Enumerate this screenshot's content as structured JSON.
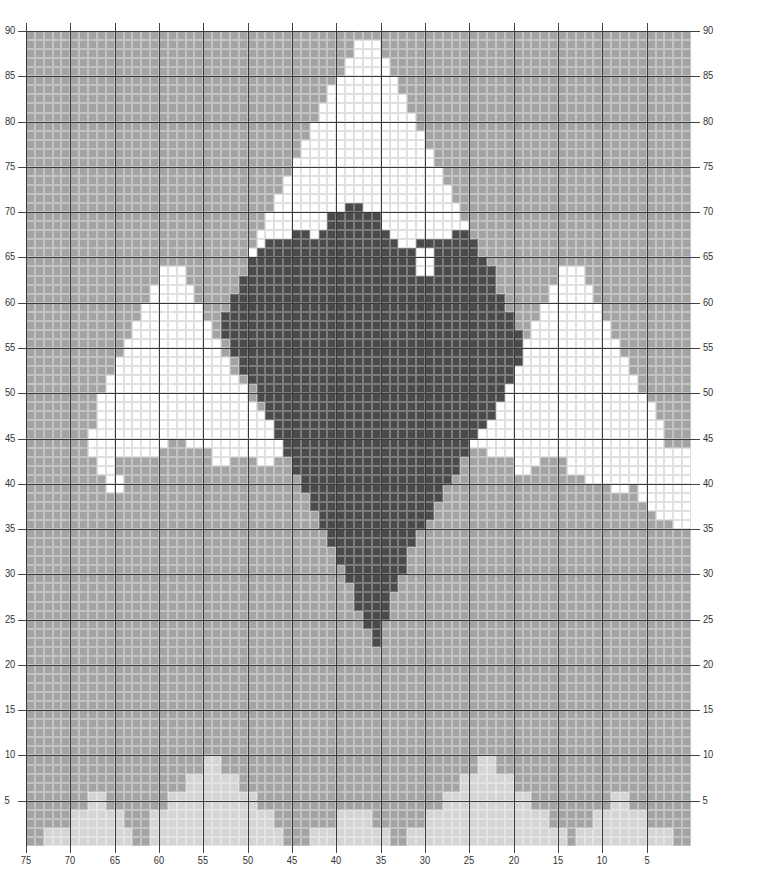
{
  "chart_data": {
    "type": "heatmap",
    "title": "",
    "columns": 75,
    "rows": 90,
    "x_axis": {
      "ticks": [
        75,
        70,
        65,
        60,
        55,
        50,
        45,
        40,
        35,
        30,
        25,
        20,
        15,
        10,
        5
      ],
      "direction": "right-to-left"
    },
    "y_axis": {
      "ticks": [
        90,
        85,
        80,
        75,
        70,
        65,
        60,
        55,
        50,
        45,
        40,
        35,
        30,
        25,
        20,
        15,
        10,
        5
      ],
      "both_sides": true
    },
    "colors": {
      "background": "#a3a3a3",
      "snow": "#ffffff",
      "dark": "#4a4a4a",
      "light": "#d4d4d4",
      "fine_grid_light": "rgba(255,255,255,0.35)",
      "fine_grid_dark": "rgba(255,255,255,0.28)",
      "fine_grid_snow": "rgba(0,0,0,0.12)",
      "major_grid": "#3a3a3a"
    },
    "legend": [
      {
        "key": "snow",
        "label": "White"
      },
      {
        "key": "dark",
        "label": "Dark grey"
      },
      {
        "key": "light",
        "label": "Light grey"
      },
      {
        "key": "background",
        "label": "Mid grey"
      }
    ],
    "layers": [
      {
        "color": "snow",
        "runs": {
          "89": [
            [
              37,
              39
            ]
          ],
          "88": [
            [
              37,
              39
            ]
          ],
          "87": [
            [
              36,
              40
            ]
          ],
          "86": [
            [
              36,
              40
            ]
          ],
          "85": [
            [
              35,
              41
            ]
          ],
          "84": [
            [
              34,
              41
            ]
          ],
          "83": [
            [
              34,
              42
            ]
          ],
          "82": [
            [
              33,
              42
            ]
          ],
          "81": [
            [
              33,
              43
            ]
          ],
          "80": [
            [
              32,
              43
            ]
          ],
          "79": [
            [
              32,
              44
            ]
          ],
          "78": [
            [
              31,
              44
            ]
          ],
          "77": [
            [
              31,
              45
            ]
          ],
          "76": [
            [
              30,
              45
            ]
          ],
          "75": [
            [
              30,
              46
            ]
          ],
          "74": [
            [
              29,
              46
            ]
          ],
          "73": [
            [
              29,
              47
            ]
          ],
          "72": [
            [
              28,
              47
            ]
          ],
          "71": [
            [
              28,
              48
            ]
          ],
          "70": [
            [
              27,
              48
            ]
          ],
          "69": [
            [
              27,
              49
            ]
          ],
          "68": [
            [
              26,
              49
            ]
          ],
          "67": [
            [
              26,
              49
            ]
          ],
          "66": [
            [
              25,
              49
            ]
          ],
          "65": [
            [
              25,
              27
            ],
            [
              44,
              45
            ]
          ],
          "64": [
            [
              15,
              17
            ],
            [
              44,
              45
            ],
            [
              60,
              62
            ]
          ],
          "63": [
            [
              15,
              17
            ],
            [
              44,
              45
            ],
            [
              60,
              62
            ]
          ],
          "62": [
            [
              14,
              18
            ],
            [
              59,
              63
            ]
          ],
          "61": [
            [
              14,
              18
            ],
            [
              59,
              63
            ]
          ],
          "60": [
            [
              13,
              19
            ],
            [
              58,
              64
            ]
          ],
          "59": [
            [
              13,
              19
            ],
            [
              58,
              64
            ]
          ],
          "58": [
            [
              12,
              20
            ],
            [
              57,
              65
            ]
          ],
          "57": [
            [
              12,
              20
            ],
            [
              57,
              65
            ]
          ],
          "56": [
            [
              11,
              21
            ],
            [
              56,
              66
            ]
          ],
          "55": [
            [
              11,
              21
            ],
            [
              56,
              66
            ]
          ],
          "54": [
            [
              10,
              22
            ],
            [
              56,
              67
            ]
          ],
          "53": [
            [
              10,
              22
            ],
            [
              55,
              67
            ]
          ],
          "52": [
            [
              9,
              23
            ],
            [
              55,
              68
            ]
          ],
          "51": [
            [
              9,
              24
            ],
            [
              54,
              68
            ]
          ],
          "50": [
            [
              8,
              24
            ],
            [
              54,
              69
            ]
          ],
          "49": [
            [
              8,
              25
            ],
            [
              53,
              70
            ]
          ],
          "48": [
            [
              8,
              26
            ],
            [
              53,
              70
            ]
          ],
          "47": [
            [
              8,
              27
            ],
            [
              52,
              71
            ]
          ],
          "46": [
            [
              7,
              27
            ],
            [
              51,
              71
            ]
          ],
          "45": [
            [
              7,
              15
            ],
            [
              18,
              28
            ],
            [
              50,
              71
            ]
          ],
          "44": [
            [
              7,
              14
            ],
            [
              21,
              28
            ],
            [
              52,
              74
            ]
          ],
          "43": [
            [
              8,
              9
            ],
            [
              21,
              22
            ],
            [
              26,
              27
            ],
            [
              55,
              57
            ],
            [
              61,
              74
            ]
          ],
          "42": [
            [
              8,
              9
            ],
            [
              55,
              56
            ],
            [
              61,
              74
            ]
          ],
          "41": [
            [
              9,
              10
            ],
            [
              63,
              74
            ]
          ],
          "40": [
            [
              9,
              10
            ],
            [
              66,
              67
            ],
            [
              69,
              74
            ]
          ],
          "39": [
            [
              69,
              74
            ]
          ],
          "38": [
            [
              70,
              74
            ]
          ],
          "37": [
            [
              71,
              74
            ]
          ],
          "36": [
            [
              73,
              74
            ]
          ]
        }
      },
      {
        "color": "dark",
        "runs": {
          "71": [
            [
              36,
              37
            ]
          ],
          "70": [
            [
              34,
              39
            ]
          ],
          "69": [
            [
              34,
              39
            ]
          ],
          "68": [
            [
              30,
              31
            ],
            [
              33,
              40
            ],
            [
              48,
              49
            ]
          ],
          "67": [
            [
              27,
              41
            ],
            [
              44,
              50
            ]
          ],
          "66": [
            [
              26,
              43
            ],
            [
              46,
              50
            ]
          ],
          "65": [
            [
              25,
              43
            ],
            [
              46,
              51
            ]
          ],
          "64": [
            [
              25,
              43
            ],
            [
              46,
              52
            ]
          ],
          "63": [
            [
              24,
              52
            ]
          ],
          "62": [
            [
              24,
              52
            ]
          ],
          "61": [
            [
              23,
              53
            ]
          ],
          "60": [
            [
              23,
              53
            ]
          ],
          "59": [
            [
              22,
              54
            ]
          ],
          "58": [
            [
              22,
              54
            ]
          ],
          "57": [
            [
              22,
              55
            ]
          ],
          "56": [
            [
              23,
              55
            ]
          ],
          "55": [
            [
              23,
              55
            ]
          ],
          "54": [
            [
              24,
              55
            ]
          ],
          "53": [
            [
              24,
              54
            ]
          ],
          "52": [
            [
              25,
              54
            ]
          ],
          "51": [
            [
              26,
              53
            ]
          ],
          "50": [
            [
              26,
              53
            ]
          ],
          "49": [
            [
              27,
              52
            ]
          ],
          "48": [
            [
              27,
              52
            ]
          ],
          "47": [
            [
              28,
              51
            ]
          ],
          "46": [
            [
              28,
              50
            ]
          ],
          "45": [
            [
              29,
              49
            ]
          ],
          "44": [
            [
              29,
              49
            ]
          ],
          "43": [
            [
              30,
              48
            ]
          ],
          "42": [
            [
              30,
              48
            ]
          ],
          "41": [
            [
              31,
              47
            ]
          ],
          "40": [
            [
              31,
              46
            ]
          ],
          "39": [
            [
              32,
              46
            ]
          ],
          "38": [
            [
              32,
              45
            ]
          ],
          "37": [
            [
              33,
              45
            ]
          ],
          "36": [
            [
              33,
              44
            ]
          ],
          "35": [
            [
              34,
              43
            ]
          ],
          "34": [
            [
              34,
              43
            ]
          ],
          "33": [
            [
              35,
              42
            ]
          ],
          "32": [
            [
              35,
              42
            ]
          ],
          "31": [
            [
              36,
              42
            ]
          ],
          "30": [
            [
              36,
              41
            ]
          ],
          "29": [
            [
              37,
              41
            ]
          ],
          "28": [
            [
              37,
              40
            ]
          ],
          "27": [
            [
              37,
              40
            ]
          ],
          "26": [
            [
              38,
              40
            ]
          ],
          "25": [
            [
              38,
              39
            ]
          ],
          "24": [
            [
              39,
              39
            ]
          ],
          "23": [
            [
              39,
              39
            ]
          ]
        }
      },
      {
        "color": "light",
        "runs": {
          "10": [
            [
              20,
              21
            ],
            [
              51,
              52
            ]
          ],
          "9": [
            [
              20,
              21
            ],
            [
              51,
              52
            ]
          ],
          "8": [
            [
              18,
              23
            ],
            [
              49,
              54
            ]
          ],
          "7": [
            [
              18,
              23
            ],
            [
              49,
              54
            ]
          ],
          "6": [
            [
              7,
              8
            ],
            [
              16,
              25
            ],
            [
              47,
              56
            ],
            [
              66,
              67
            ]
          ],
          "5": [
            [
              7,
              8
            ],
            [
              16,
              25
            ],
            [
              47,
              56
            ],
            [
              66,
              67
            ]
          ],
          "4": [
            [
              5,
              10
            ],
            [
              14,
              27
            ],
            [
              35,
              38
            ],
            [
              45,
              58
            ],
            [
              64,
              69
            ]
          ],
          "3": [
            [
              5,
              10
            ],
            [
              14,
              27
            ],
            [
              35,
              38
            ],
            [
              45,
              58
            ],
            [
              64,
              69
            ]
          ],
          "2": [
            [
              2,
              11
            ],
            [
              14,
              28
            ],
            [
              32,
              40
            ],
            [
              43,
              60
            ],
            [
              62,
              72
            ]
          ],
          "1": [
            [
              2,
              11
            ],
            [
              14,
              28
            ],
            [
              32,
              40
            ],
            [
              43,
              60
            ],
            [
              62,
              72
            ]
          ]
        }
      }
    ]
  },
  "axis_labels": {
    "y": [
      "90",
      "85",
      "80",
      "75",
      "70",
      "65",
      "60",
      "55",
      "50",
      "45",
      "40",
      "35",
      "30",
      "25",
      "20",
      "15",
      "10",
      "5"
    ],
    "x": [
      "75",
      "70",
      "65",
      "60",
      "55",
      "50",
      "45",
      "40",
      "35",
      "30",
      "25",
      "20",
      "15",
      "10",
      "5"
    ]
  }
}
